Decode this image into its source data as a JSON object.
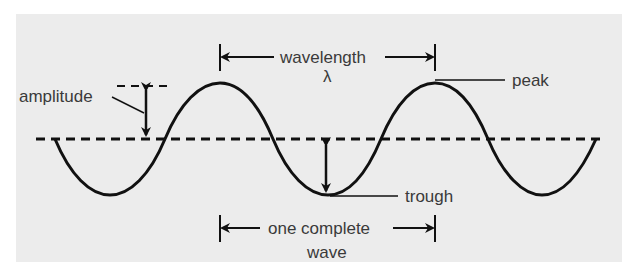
{
  "diagram": {
    "type": "transverse-wave",
    "labels": {
      "amplitude": "amplitude",
      "wavelength": "wavelength",
      "lambda": "λ",
      "peak": "peak",
      "trough": "trough",
      "one_complete": "one complete",
      "wave": "wave"
    },
    "colors": {
      "background": "#ececec",
      "line": "#111111",
      "text": "#3a3a3a"
    }
  }
}
